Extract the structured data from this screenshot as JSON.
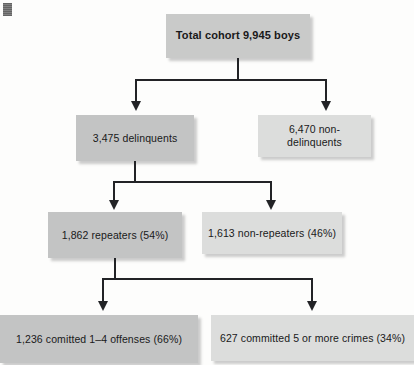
{
  "figure": {
    "type": "flowchart",
    "orientation": "top-down",
    "levels": 4
  },
  "nodes": {
    "total": {
      "label": "Total cohort 9,945 boys",
      "shade": "#c9cac9"
    },
    "delinquent": {
      "label": "3,475 delinquents",
      "shade": "#c3c4c4"
    },
    "nondelinquent": {
      "label": "6,470 non-delinquents",
      "shade": "#dcdddc"
    },
    "repeaters": {
      "label": "1,862 repeaters (54%)",
      "shade": "#c3c4c4"
    },
    "nonrepeaters": {
      "label": "1,613 non-repeaters (46%)",
      "shade": "#dcdddc"
    },
    "offenses": {
      "label": "1,236 comitted 1–4 offenses (66%)",
      "shade": "#c3c4c4"
    },
    "crimes": {
      "label": "627 committed 5 or more crimes (34%)",
      "shade": "#dcdddc"
    }
  },
  "colors": {
    "background": "#fdfdfc",
    "connector": "#222326",
    "text": "#19191a",
    "box_dark": "#c3c4c4",
    "box_light": "#dcdddc",
    "box_top": "#c9cac9"
  }
}
